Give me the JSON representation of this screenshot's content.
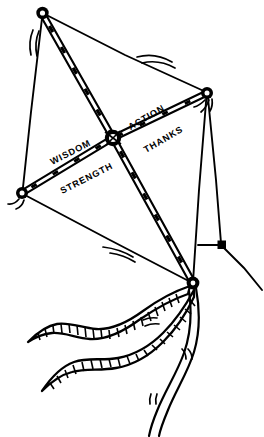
{
  "illustration": {
    "title": "Kite with labeled spars",
    "subject": "kite-line-drawing",
    "background_color": "#ffffff",
    "ink_color": "#000000",
    "labels": [
      {
        "id": "wisdom",
        "text": "WISDOM",
        "x": 72,
        "y": 155,
        "rotation": -27,
        "position": "above-left-spar"
      },
      {
        "id": "strength",
        "text": "STRENGTH",
        "x": 88,
        "y": 180,
        "rotation": -27,
        "position": "below-left-spar"
      },
      {
        "id": "action",
        "text": "ACTION",
        "x": 147,
        "y": 120,
        "rotation": -30,
        "position": "above-right-spar"
      },
      {
        "id": "thanks",
        "text": "THANKS",
        "x": 163,
        "y": 141,
        "rotation": -30,
        "position": "below-right-spar"
      }
    ],
    "nodes": [
      {
        "id": "apex-top",
        "x": 42,
        "y": 13,
        "label": "top-apex-knot"
      },
      {
        "id": "node-left",
        "x": 22,
        "y": 193,
        "label": "left-wingtip-knot"
      },
      {
        "id": "node-right",
        "x": 207,
        "y": 93,
        "label": "right-wingtip-knot"
      },
      {
        "id": "hub-center",
        "x": 113,
        "y": 138,
        "label": "center-cross-joint"
      },
      {
        "id": "node-bottom",
        "x": 193,
        "y": 283,
        "label": "bottom-tail-knot"
      },
      {
        "id": "bridle-knot",
        "x": 222,
        "y": 245,
        "label": "bridle-tow-point"
      }
    ],
    "spars": [
      {
        "id": "spar-wisdom-strength",
        "from": "apex-top",
        "to": "node-bottom",
        "labels": [
          "WISDOM",
          "STRENGTH"
        ]
      },
      {
        "id": "spar-action-thanks",
        "from": "node-left",
        "to": "node-right",
        "labels": [
          "ACTION",
          "THANKS"
        ]
      }
    ],
    "tails": [
      {
        "id": "tail-upper",
        "style": "striped-ribbon"
      },
      {
        "id": "tail-lower",
        "style": "striped-ribbon"
      }
    ],
    "motion_marks": 5,
    "flying_line": {
      "from": "bridle-knot",
      "direction": "down-right"
    }
  }
}
